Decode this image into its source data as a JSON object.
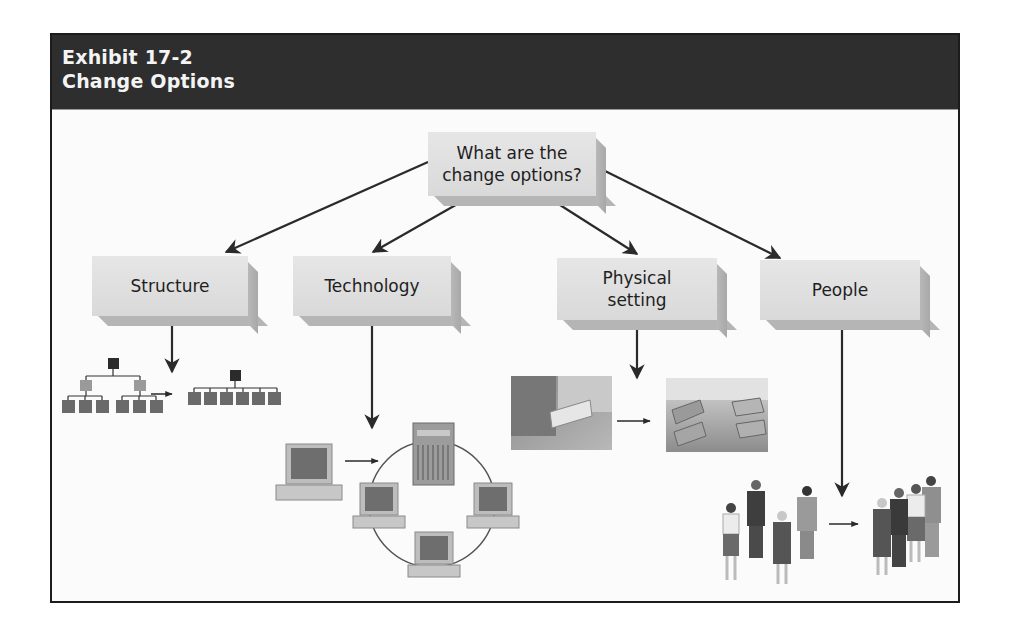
{
  "header": {
    "line1": "Exhibit 17-2",
    "line2": "Change Options"
  },
  "diagram": {
    "root": {
      "label_line1": "What are the",
      "label_line2": "change options?"
    },
    "options": [
      {
        "id": "structure",
        "label": "Structure",
        "illustration": "org-chart-flattening"
      },
      {
        "id": "technology",
        "label": "Technology",
        "illustration": "computer-joining-network"
      },
      {
        "id": "physical-setting",
        "label_line1": "Physical",
        "label_line2": "setting",
        "illustration": "office-layout-change"
      },
      {
        "id": "people",
        "label": "People",
        "illustration": "individuals-to-team"
      }
    ]
  },
  "colors": {
    "header_bg": "#2e2e2e",
    "header_text": "#f4f4f4",
    "box_bg": "#e0e0e0",
    "arrow": "#2a2a2a"
  }
}
